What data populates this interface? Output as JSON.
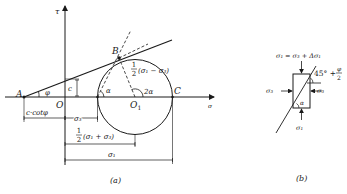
{
  "figure_a": {
    "caption": "(a)",
    "axes": {
      "x_label": "σ",
      "y_label": "τ"
    },
    "points": {
      "A": "A",
      "B": "B",
      "O": "O",
      "O1": "O",
      "O1_sub": "1",
      "C": "C"
    },
    "angles": {
      "phi": "φ",
      "alpha": "α",
      "two_alpha": "2α"
    },
    "cohesion": "c",
    "radius_label": {
      "frac": "1",
      "den": "2",
      "expr": "(σ₁ − σ₃)"
    },
    "dimensions": {
      "c_cot_phi": "c·cotφ",
      "sigma3": "σ₃",
      "half_sum": {
        "frac": "1",
        "den": "2",
        "expr": "(σ₁ + σ₃)"
      },
      "sigma1": "σ₁"
    }
  },
  "figure_b": {
    "caption": "(b)",
    "top_load": "σ₁ = σ₃ + Δσ₁",
    "bottom_load": "σ₁",
    "left_load": "σ₃",
    "right_load": "σ₃",
    "alpha": "α",
    "angle_label": "45° + ",
    "angle_frac_num": "φ",
    "angle_frac_den": "2"
  }
}
